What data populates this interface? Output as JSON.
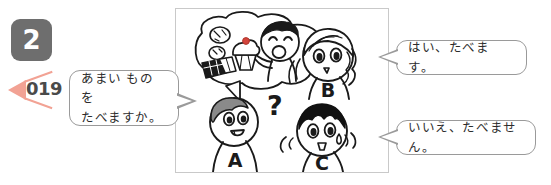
{
  "exercise": {
    "number": "2",
    "badge_color": "#6e6e6e"
  },
  "audio": {
    "track_number": "019",
    "marker_icon": "play-triangle-left-icon",
    "marker_color": "#f2a294"
  },
  "bubbles": {
    "question": {
      "text": "あまい ものを\nたべますか。",
      "speaker": "A"
    },
    "answer_yes": {
      "text": "はい、たべます。",
      "speaker": "B"
    },
    "answer_no": {
      "text": "いいえ、たべません。",
      "speaker": "C"
    }
  },
  "illustration": {
    "panel_label": "conversation-illustration",
    "characters": [
      {
        "label": "A",
        "role": "asker",
        "hair": "gray",
        "expression": "smiling-questioning",
        "marks": [
          "question-mark"
        ]
      },
      {
        "label": "B",
        "role": "answers-yes",
        "hair": "wavy-long",
        "expression": "nodding",
        "marks": [
          "motion-lines"
        ]
      },
      {
        "label": "C",
        "role": "answers-no",
        "hair": "black-spiky",
        "expression": "sweating",
        "marks": [
          "sweat-drop",
          "motion-lines"
        ]
      }
    ],
    "thought_bubble": {
      "owner": "A",
      "contents": [
        "cupcake-with-cherry",
        "cookie",
        "chocolate-bar",
        "boy-eating"
      ]
    }
  },
  "colors": {
    "ink": "#2c2c2c",
    "bubble_border": "#9a9a9a",
    "panel_border": "#c9c9c9",
    "cherry_red": "#d4443c",
    "hair_gray": "#8a8a8a",
    "hair_black": "#111111"
  }
}
